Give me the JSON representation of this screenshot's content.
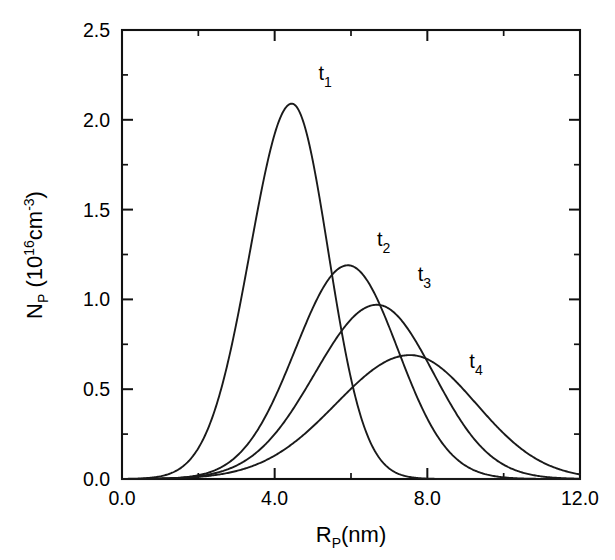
{
  "chart_data": {
    "type": "line",
    "title": "",
    "subtitle": "",
    "xlabel": "R_P(nm)",
    "xlabel_parts": {
      "base": "R",
      "sub": "P",
      "tail": "(nm)"
    },
    "ylabel": "N_P (10^16 cm^-3)",
    "ylabel_parts": {
      "base": "N",
      "sub": "P",
      "mid": " (10",
      "exp1": "16",
      "unit": "cm",
      "exp2": "-3",
      "close": ")"
    },
    "xlim": [
      0.0,
      12.0
    ],
    "ylim": [
      0.0,
      2.5
    ],
    "grid": false,
    "legend_position": "inline-annotations",
    "x_major_ticks": [
      0.0,
      4.0,
      8.0,
      12.0
    ],
    "x_major_ticklabels": [
      "0.0",
      "4.0",
      "8.0",
      "12.0"
    ],
    "x_minor_ticks": [
      2.0,
      6.0,
      10.0
    ],
    "y_major_ticks": [
      0.0,
      0.5,
      1.0,
      1.5,
      2.0,
      2.5
    ],
    "y_major_ticklabels": [
      "0.0",
      "0.5",
      "1.0",
      "1.5",
      "2.0",
      "2.5"
    ],
    "y_minor_ticks": [
      0.25,
      0.75,
      1.25,
      1.75,
      2.25
    ],
    "tick_direction": "in",
    "frame": "box",
    "series": [
      {
        "name": "t1",
        "label_base": "t",
        "label_sub": "1",
        "label_x": 5.15,
        "label_y": 2.22,
        "peak_x": 4.45,
        "peak_y": 2.09,
        "width_left": 1.55,
        "width_right": 1.35,
        "x": [
          0.0,
          0.4,
          0.8,
          1.2,
          1.6,
          2.0,
          2.4,
          2.8,
          3.2,
          3.6,
          4.0,
          4.45,
          4.8,
          5.2,
          5.6,
          6.0,
          6.4,
          6.8,
          7.2,
          7.6,
          8.0,
          8.4,
          9.0,
          10.0,
          12.0
        ],
        "y": [
          0.0,
          0.005,
          0.02,
          0.07,
          0.2,
          0.44,
          0.82,
          1.3,
          1.74,
          1.99,
          2.08,
          2.09,
          2.0,
          1.74,
          1.36,
          0.95,
          0.58,
          0.31,
          0.14,
          0.05,
          0.015,
          0.004,
          0.0,
          0.0,
          0.0
        ]
      },
      {
        "name": "t2",
        "label_base": "t",
        "label_sub": "2",
        "label_x": 6.68,
        "label_y": 1.3,
        "peak_x": 5.92,
        "peak_y": 1.19,
        "width_left": 1.95,
        "width_right": 1.85,
        "x": [
          0.0,
          0.8,
          1.6,
          2.4,
          3.0,
          3.6,
          4.2,
          4.8,
          5.4,
          5.92,
          6.4,
          7.0,
          7.6,
          8.2,
          8.8,
          9.4,
          10.0,
          10.6,
          11.2,
          12.0
        ],
        "y": [
          0.0,
          0.005,
          0.02,
          0.09,
          0.2,
          0.4,
          0.67,
          0.94,
          1.12,
          1.19,
          1.15,
          1.0,
          0.79,
          0.55,
          0.34,
          0.19,
          0.09,
          0.04,
          0.015,
          0.004
        ]
      },
      {
        "name": "t3",
        "label_base": "t",
        "label_sub": "3",
        "label_x": 7.75,
        "label_y": 1.1,
        "peak_x": 6.68,
        "peak_y": 0.97,
        "width_left": 2.3,
        "width_right": 2.1,
        "x": [
          0.0,
          0.8,
          1.6,
          2.4,
          3.2,
          4.0,
          4.6,
          5.2,
          5.8,
          6.2,
          6.68,
          7.2,
          7.8,
          8.4,
          9.0,
          9.6,
          10.2,
          10.8,
          11.4,
          12.0
        ],
        "y": [
          0.0,
          0.003,
          0.015,
          0.06,
          0.15,
          0.33,
          0.5,
          0.68,
          0.85,
          0.92,
          0.97,
          0.94,
          0.83,
          0.66,
          0.47,
          0.3,
          0.17,
          0.085,
          0.035,
          0.012
        ]
      },
      {
        "name": "t4",
        "label_base": "t",
        "label_sub": "4",
        "label_x": 9.1,
        "label_y": 0.62,
        "peak_x": 7.55,
        "peak_y": 0.69,
        "width_left": 2.75,
        "width_right": 2.45,
        "x": [
          0.0,
          1.0,
          2.0,
          3.0,
          3.8,
          4.6,
          5.4,
          6.2,
          6.9,
          7.55,
          8.2,
          8.8,
          9.4,
          10.0,
          10.6,
          11.2,
          11.6,
          12.0
        ],
        "y": [
          0.0,
          0.002,
          0.012,
          0.05,
          0.11,
          0.21,
          0.35,
          0.5,
          0.62,
          0.69,
          0.67,
          0.6,
          0.49,
          0.37,
          0.25,
          0.15,
          0.1,
          0.06
        ]
      }
    ],
    "colors": {
      "curve": "#1a1a1a",
      "axis": "#111111",
      "background": "#ffffff"
    }
  }
}
